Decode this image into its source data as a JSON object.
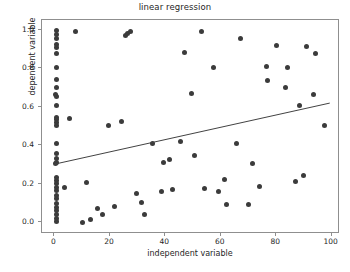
{
  "chart_data": {
    "type": "scatter",
    "title": "linear regression",
    "xlabel": "independent variable",
    "ylabel": "dependent variable",
    "xlim": [
      -4.5,
      103
    ],
    "ylim": [
      -0.06,
      1.05
    ],
    "xticks": [
      0,
      20,
      40,
      60,
      80,
      100
    ],
    "xtick_labels": [
      "0",
      "20",
      "40",
      "60",
      "80",
      "100"
    ],
    "yticks": [
      0.0,
      0.2,
      0.4,
      0.6,
      0.8,
      1.0
    ],
    "ytick_labels": [
      "0.0",
      "0.2",
      "0.4",
      "0.6",
      "0.8",
      "1.0"
    ],
    "grid": false,
    "legend": "none",
    "marker_color": "#3b3b3b",
    "line_color": "#404040",
    "frame_color": "#8f8f8f",
    "points": [
      [
        0.6,
        0.995
      ],
      [
        0.6,
        0.975
      ],
      [
        0.7,
        0.955
      ],
      [
        0.6,
        0.925
      ],
      [
        0.6,
        0.905
      ],
      [
        0.7,
        0.875
      ],
      [
        0.6,
        0.805
      ],
      [
        0.6,
        0.74
      ],
      [
        0.6,
        0.7
      ],
      [
        0.5,
        0.665
      ],
      [
        0.9,
        0.655
      ],
      [
        0.6,
        0.605
      ],
      [
        0.6,
        0.545
      ],
      [
        0.9,
        0.535
      ],
      [
        0.6,
        0.52
      ],
      [
        0.6,
        0.505
      ],
      [
        0.6,
        0.412
      ],
      [
        0.6,
        0.36
      ],
      [
        0.6,
        0.33
      ],
      [
        0.9,
        0.31
      ],
      [
        0.5,
        0.305
      ],
      [
        0.6,
        0.232
      ],
      [
        0.6,
        0.215
      ],
      [
        0.6,
        0.2
      ],
      [
        0.6,
        0.182
      ],
      [
        0.6,
        0.165
      ],
      [
        0.6,
        0.14
      ],
      [
        0.6,
        0.122
      ],
      [
        0.6,
        0.098
      ],
      [
        0.6,
        0.08
      ],
      [
        0.6,
        0.062
      ],
      [
        0.6,
        0.04
      ],
      [
        0.6,
        0.022
      ],
      [
        0.6,
        0.005
      ],
      [
        3.5,
        0.182
      ],
      [
        5.5,
        0.538
      ],
      [
        7.5,
        0.988
      ],
      [
        10.0,
        0.002
      ],
      [
        11.5,
        0.205
      ],
      [
        13.0,
        0.015
      ],
      [
        15.5,
        0.072
      ],
      [
        17.5,
        0.042
      ],
      [
        19.5,
        0.505
      ],
      [
        21.5,
        0.082
      ],
      [
        24.0,
        0.525
      ],
      [
        25.5,
        0.972
      ],
      [
        26.5,
        0.978
      ],
      [
        27.5,
        0.988
      ],
      [
        29.5,
        0.152
      ],
      [
        31.5,
        0.102
      ],
      [
        32.5,
        0.042
      ],
      [
        35.5,
        0.408
      ],
      [
        38.5,
        0.158
      ],
      [
        39.5,
        0.312
      ],
      [
        41.5,
        0.325
      ],
      [
        42.5,
        0.172
      ],
      [
        45.5,
        0.418
      ],
      [
        47.0,
        0.882
      ],
      [
        49.5,
        0.668
      ],
      [
        50.5,
        0.345
      ],
      [
        53.0,
        0.988
      ],
      [
        54.0,
        0.178
      ],
      [
        57.5,
        0.805
      ],
      [
        59.0,
        0.162
      ],
      [
        61.5,
        0.225
      ],
      [
        62.0,
        0.095
      ],
      [
        65.5,
        0.412
      ],
      [
        67.0,
        0.952
      ],
      [
        70.0,
        0.095
      ],
      [
        71.5,
        0.308
      ],
      [
        74.0,
        0.185
      ],
      [
        76.5,
        0.808
      ],
      [
        77.0,
        0.738
      ],
      [
        80.0,
        0.918
      ],
      [
        83.5,
        0.702
      ],
      [
        84.0,
        0.805
      ],
      [
        87.0,
        0.212
      ],
      [
        88.5,
        0.605
      ],
      [
        90.0,
        0.245
      ],
      [
        91.0,
        0.915
      ],
      [
        93.5,
        0.662
      ],
      [
        94.0,
        0.875
      ],
      [
        97.5,
        0.502
      ]
    ],
    "regression_line": {
      "x_start": 0,
      "y_start": 0.295,
      "x_end": 100,
      "y_end": 0.615,
      "slope": 0.0032,
      "intercept": 0.295
    }
  }
}
